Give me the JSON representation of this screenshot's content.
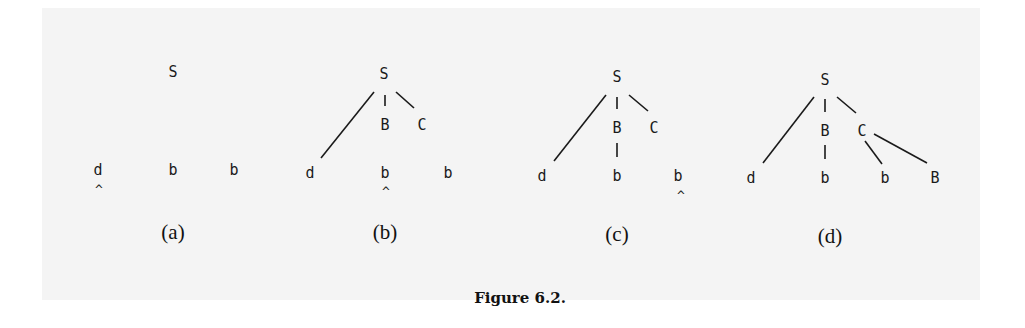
{
  "figure": {
    "caption": "Figure 6.2.",
    "panels": [
      {
        "label": "(a)",
        "nodes": {
          "root": "S",
          "leaf1": "d",
          "leaf2": "b",
          "leaf3": "b"
        },
        "pointer": "^",
        "pointer_at": "leaf1"
      },
      {
        "label": "(b)",
        "nodes": {
          "root": "S",
          "child_b": "B",
          "child_c": "C",
          "leaf1": "d",
          "leaf2": "b",
          "leaf3": "b"
        },
        "pointer": "^",
        "pointer_at": "leaf2"
      },
      {
        "label": "(c)",
        "nodes": {
          "root": "S",
          "child_b": "B",
          "child_c": "C",
          "leaf1": "d",
          "leaf2": "b",
          "leaf3": "b"
        },
        "pointer": "^",
        "pointer_at": "leaf3"
      },
      {
        "label": "(d)",
        "nodes": {
          "root": "S",
          "child_b": "B",
          "child_c": "C",
          "leaf1": "d",
          "leaf2": "b",
          "leaf3": "b",
          "leaf4": "B"
        }
      }
    ]
  }
}
